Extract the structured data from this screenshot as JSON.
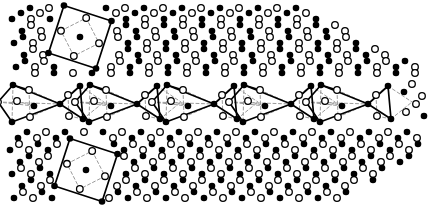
{
  "figure": {
    "title": "",
    "caption": "",
    "background_color": "#ffffff",
    "width": 428,
    "height": 207
  },
  "style": {
    "filled_atom_color": "#000000",
    "open_atom_fill": "#ffffff",
    "open_atom_stroke": "#000000",
    "bond_solid_color": "#000000",
    "bond_dashed_color": "#9a9a9a",
    "atom_radius": 3.3,
    "open_atom_radius": 3.3,
    "open_atom_stroke_width": 1.3,
    "bond_solid_width": 1.7,
    "bond_dashed_width": 1.0,
    "bond_dash_pattern": "3,2.5"
  },
  "legend": {
    "filled_label": "filled-atom",
    "open_label": "open-atom",
    "solid_bond_label": "solid-bond",
    "dashed_bond_label": "dashed-bond"
  },
  "lattice": {
    "description": "two-dimensional alternating filled/open atom lattice substrate",
    "row_spacing": 17.2,
    "column_spacing": 19.0,
    "row_shear": -4.2,
    "rows": [
      {
        "y": 8,
        "x_start": 30,
        "count": 21,
        "first": "open",
        "phase": 0
      },
      {
        "y": 19,
        "x_start": 12,
        "count": 22,
        "first": "filled",
        "phase": 1
      },
      {
        "y": 31,
        "x_start": 22,
        "count": 21,
        "first": "open",
        "phase": 0
      },
      {
        "y": 43,
        "x_start": 14,
        "count": 22,
        "first": "filled",
        "phase": 1
      },
      {
        "y": 55,
        "x_start": 24,
        "count": 21,
        "first": "open",
        "phase": 0
      },
      {
        "y": 67,
        "x_start": 16,
        "count": 22,
        "first": "filled",
        "phase": 1
      },
      {
        "y": 138,
        "x_start": 18,
        "count": 22,
        "first": "open",
        "phase": 0
      },
      {
        "y": 150,
        "x_start": 10,
        "count": 22,
        "first": "filled",
        "phase": 1
      },
      {
        "y": 162,
        "x_start": 20,
        "count": 21,
        "first": "open",
        "phase": 0
      },
      {
        "y": 174,
        "x_start": 12,
        "count": 22,
        "first": "filled",
        "phase": 1
      },
      {
        "y": 186,
        "x_start": 22,
        "count": 21,
        "first": "open",
        "phase": 0
      },
      {
        "y": 198,
        "x_start": 14,
        "count": 21,
        "first": "filled",
        "phase": 1
      }
    ]
  },
  "clusters": {
    "square_clusters": [
      {
        "name": "top-square-cluster",
        "center": {
          "x": 80,
          "y": 37
        },
        "rotation_deg": 18,
        "half_size": 25,
        "corner_atoms": "filled",
        "edge_atoms": "open",
        "center_atom": "filled",
        "corner_count": 4,
        "edge_count": 4
      },
      {
        "name": "bottom-square-cluster",
        "center": {
          "x": 86,
          "y": 170
        },
        "rotation_deg": 18,
        "half_size": 25,
        "corner_atoms": "filled",
        "edge_atoms": "open",
        "center_atom": "filled",
        "corner_count": 4,
        "edge_count": 4
      }
    ],
    "chain": {
      "name": "middle-bowtie-chain",
      "unit_count": 5,
      "period": 77,
      "first_hub_x": 60,
      "hub_y": 104,
      "unit_description": "quadrilateral of four filled atoms enclosing two open atoms, joined at a filled hub to a triangle of filled atoms enclosing one open atom",
      "hub_atom": "filled"
    }
  },
  "counts": {
    "square_cluster_total": 2,
    "chain_unit_total": 5
  }
}
